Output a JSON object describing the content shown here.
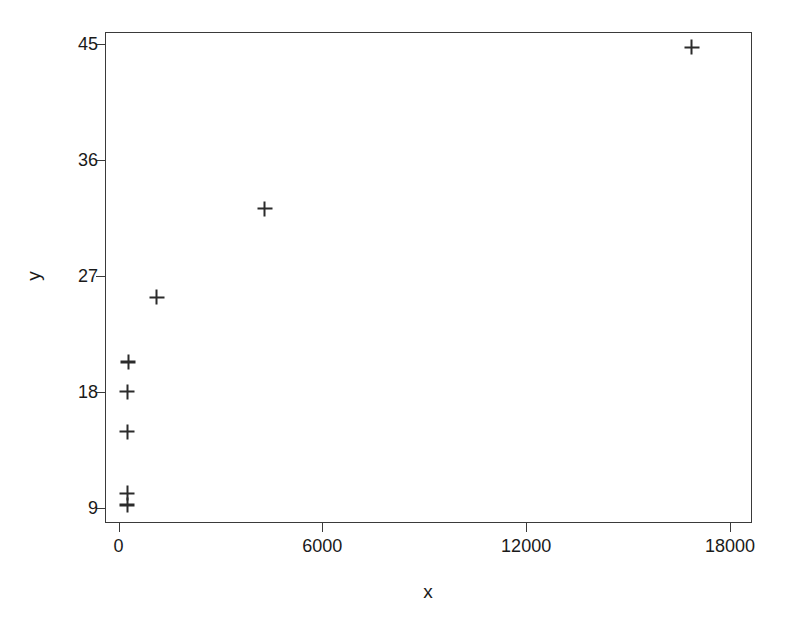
{
  "chart_data": {
    "type": "scatter",
    "title": "",
    "xlabel": "x",
    "ylabel": "y",
    "xlim": [
      -400,
      18650
    ],
    "ylim": [
      7.8,
      45.9
    ],
    "xticks": [
      0,
      6000,
      12000,
      18000
    ],
    "yticks": [
      9,
      18,
      27,
      36,
      45
    ],
    "xticklabels": [
      "0",
      "6000",
      "12000",
      "18000"
    ],
    "yticklabels": [
      "9",
      "18",
      "27",
      "36",
      "45"
    ],
    "grid": false,
    "legend": false,
    "marker": "plus",
    "marker_color": "#2b2b2b",
    "frame_color": "#3a3a3a",
    "background": "#ffffff",
    "n_points": 8,
    "points": [
      {
        "x": 260,
        "y": 9.2
      },
      {
        "x": 260,
        "y": 10.1
      },
      {
        "x": 260,
        "y": 14.9
      },
      {
        "x": 260,
        "y": 18.0
      },
      {
        "x": 290,
        "y": 20.3
      },
      {
        "x": 1125,
        "y": 25.3
      },
      {
        "x": 4300,
        "y": 32.2
      },
      {
        "x": 16870,
        "y": 44.7
      }
    ],
    "x": [
      260,
      260,
      260,
      260,
      290,
      1125,
      4300,
      16870
    ],
    "y": [
      9.2,
      10.1,
      14.9,
      18.0,
      20.3,
      25.3,
      32.2,
      44.7
    ]
  }
}
